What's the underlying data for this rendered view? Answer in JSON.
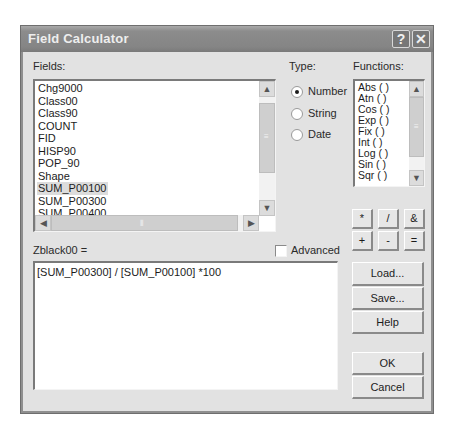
{
  "window": {
    "title": "Field Calculator",
    "help_button": "?",
    "close_button": "✕"
  },
  "fields": {
    "label": "Fields:",
    "items": [
      "Chg9000",
      "Class00",
      "Class90",
      "COUNT",
      "FID",
      "HISP90",
      "POP_90",
      "Shape",
      "SUM_P00100",
      "SUM_P00300",
      "SUM_P00400"
    ],
    "selected": "SUM_P00100"
  },
  "type": {
    "label": "Type:",
    "options": [
      "Number",
      "String",
      "Date"
    ],
    "selected": "Number"
  },
  "functions": {
    "label": "Functions:",
    "items": [
      "Abs ( )",
      "Atn ( )",
      "Cos ( )",
      "Exp ( )",
      "Fix ( )",
      "Int ( )",
      "Log ( )",
      "Sin ( )",
      "Sqr ( )"
    ]
  },
  "operators": [
    "*",
    "/",
    "&",
    "+",
    "-",
    "="
  ],
  "expression": {
    "label": "Zblack00 =",
    "value": "[SUM_P00300] / [SUM_P00100] *100"
  },
  "advanced": {
    "label": "Advanced",
    "checked": false
  },
  "buttons": {
    "load": "Load...",
    "save": "Save...",
    "help": "Help",
    "ok": "OK",
    "cancel": "Cancel"
  },
  "scrollbar_glyphs": {
    "up": "▲",
    "down": "▼",
    "left": "◀",
    "right": "▶",
    "grip_v": "≡",
    "grip_h": "⦀"
  }
}
